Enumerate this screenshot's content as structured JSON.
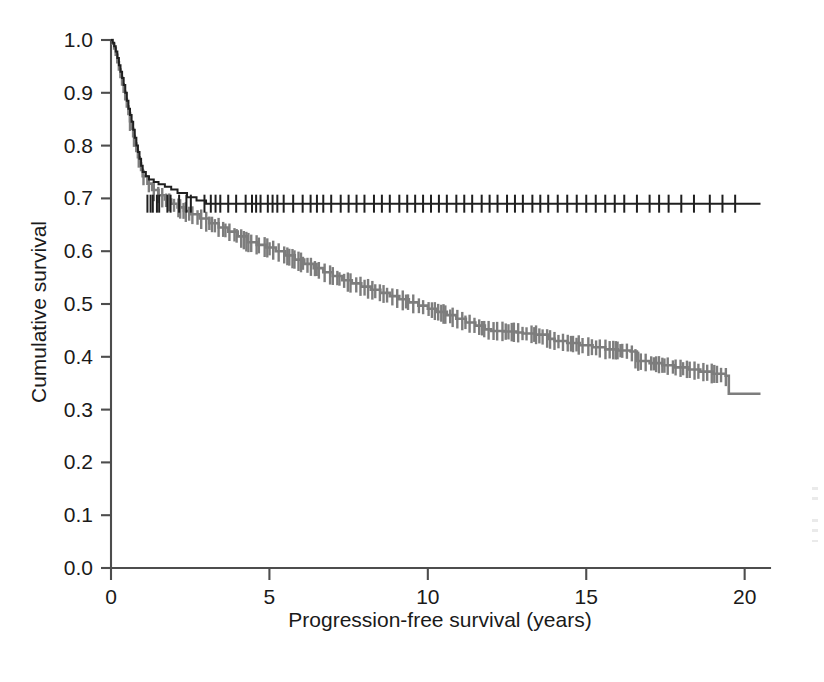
{
  "chart_data": {
    "type": "line",
    "title": "",
    "subtitle": "",
    "xlabel": "Progression-free survival (years)",
    "ylabel": "Cumulative survival",
    "xlim": [
      0,
      20.8
    ],
    "ylim": [
      0.0,
      1.0
    ],
    "xticks": [
      0,
      5,
      10,
      15,
      20
    ],
    "xtick_labels": [
      "0",
      "5",
      "10",
      "15",
      "20"
    ],
    "yticks": [
      0.0,
      0.1,
      0.2,
      0.3,
      0.4,
      0.5,
      0.6,
      0.7,
      0.8,
      0.9,
      1.0
    ],
    "ytick_labels": [
      "0.0",
      "0.1",
      "0.2",
      "0.3",
      "0.4",
      "0.5",
      "0.6",
      "0.7",
      "0.8",
      "0.9",
      "1.0"
    ],
    "grid": false,
    "legend": false,
    "legend_position": "none",
    "annotations": [],
    "colors": {
      "series_upper": "#1f1f1f",
      "series_lower": "#7d7d7d",
      "axis": "#4d4d4d",
      "background": "#ffffff"
    },
    "series": [
      {
        "name": "upper-curve",
        "color": "#1f1f1f",
        "style": "kaplan-meier-step",
        "plateau_value": 0.69,
        "final_value": 0.69,
        "x": [
          0.0,
          0.05,
          0.1,
          0.15,
          0.2,
          0.25,
          0.3,
          0.35,
          0.4,
          0.45,
          0.5,
          0.55,
          0.6,
          0.65,
          0.7,
          0.75,
          0.8,
          0.85,
          0.9,
          0.95,
          1.0,
          1.1,
          1.2,
          1.35,
          1.5,
          1.7,
          1.9,
          2.1,
          2.4,
          2.7,
          3.0,
          20.5
        ],
        "y": [
          1.0,
          0.995,
          0.988,
          0.978,
          0.966,
          0.952,
          0.94,
          0.928,
          0.915,
          0.9,
          0.885,
          0.87,
          0.858,
          0.845,
          0.83,
          0.815,
          0.8,
          0.788,
          0.775,
          0.762,
          0.75,
          0.742,
          0.736,
          0.731,
          0.727,
          0.722,
          0.717,
          0.71,
          0.702,
          0.696,
          0.69,
          0.69
        ],
        "censor_x": [
          1.15,
          1.25,
          1.32,
          1.45,
          1.52,
          1.78,
          1.88,
          2.15,
          2.38,
          2.52,
          2.95,
          3.15,
          3.3,
          3.45,
          3.7,
          3.95,
          4.25,
          4.45,
          4.58,
          4.72,
          4.95,
          5.1,
          5.25,
          5.45,
          5.75,
          6.05,
          6.3,
          6.5,
          6.7,
          6.95,
          7.25,
          7.5,
          7.75,
          8.0,
          8.3,
          8.55,
          8.8,
          9.1,
          9.35,
          9.6,
          9.85,
          10.1,
          10.35,
          10.6,
          10.9,
          11.15,
          11.4,
          11.7,
          11.95,
          12.2,
          12.5,
          12.75,
          13.0,
          13.3,
          13.55,
          13.8,
          14.1,
          14.4,
          14.7,
          15.0,
          15.3,
          15.6,
          15.9,
          16.2,
          16.6,
          17.0,
          17.3,
          17.6,
          18.0,
          18.4,
          18.9,
          19.3,
          19.7
        ],
        "censor_y": 0.69
      },
      {
        "name": "lower-curve",
        "color": "#7d7d7d",
        "style": "kaplan-meier-step",
        "final_value": 0.33,
        "x": [
          0.0,
          0.05,
          0.1,
          0.15,
          0.2,
          0.25,
          0.3,
          0.35,
          0.4,
          0.45,
          0.5,
          0.55,
          0.6,
          0.65,
          0.7,
          0.75,
          0.8,
          0.85,
          0.9,
          0.95,
          1.0,
          1.15,
          1.3,
          1.5,
          1.7,
          1.9,
          2.1,
          2.3,
          2.5,
          2.8,
          3.1,
          3.4,
          3.7,
          4.0,
          4.3,
          4.6,
          4.9,
          5.2,
          5.5,
          5.8,
          6.1,
          6.4,
          6.7,
          7.0,
          7.3,
          7.6,
          7.9,
          8.2,
          8.5,
          8.8,
          9.1,
          9.4,
          9.7,
          10.0,
          10.3,
          10.6,
          10.9,
          11.2,
          11.5,
          11.8,
          12.0,
          12.4,
          12.8,
          13.0,
          13.4,
          13.8,
          14.0,
          14.4,
          14.8,
          15.2,
          15.6,
          16.0,
          16.4,
          16.6,
          17.0,
          17.4,
          17.8,
          18.2,
          18.6,
          19.0,
          19.4,
          19.5,
          20.5
        ],
        "y": [
          1.0,
          0.993,
          0.984,
          0.972,
          0.958,
          0.944,
          0.93,
          0.916,
          0.902,
          0.888,
          0.874,
          0.86,
          0.846,
          0.832,
          0.818,
          0.804,
          0.79,
          0.778,
          0.766,
          0.754,
          0.742,
          0.728,
          0.716,
          0.706,
          0.698,
          0.69,
          0.683,
          0.676,
          0.67,
          0.662,
          0.653,
          0.645,
          0.637,
          0.628,
          0.617,
          0.612,
          0.607,
          0.6,
          0.592,
          0.584,
          0.576,
          0.568,
          0.56,
          0.553,
          0.545,
          0.539,
          0.533,
          0.527,
          0.521,
          0.515,
          0.509,
          0.503,
          0.497,
          0.491,
          0.485,
          0.479,
          0.472,
          0.465,
          0.459,
          0.452,
          0.449,
          0.448,
          0.446,
          0.444,
          0.442,
          0.434,
          0.43,
          0.426,
          0.422,
          0.418,
          0.414,
          0.412,
          0.41,
          0.392,
          0.388,
          0.384,
          0.38,
          0.376,
          0.372,
          0.368,
          0.364,
          0.33,
          0.33
        ],
        "censor_dense_from": 0.6,
        "censor_dense_to": 19.5
      }
    ]
  }
}
